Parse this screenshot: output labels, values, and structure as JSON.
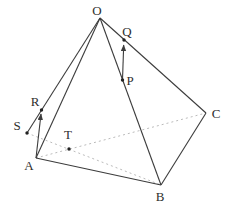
{
  "figure": {
    "width": 230,
    "height": 212,
    "background": "#ffffff",
    "solid_color": "#3c3c3c",
    "dashed_color": "#b3b3b3",
    "dot_color": "#222222",
    "label_color": "#2e2e2e",
    "solid_width": 1.1,
    "dashed_width": 0.9,
    "dash_pattern": "2 3",
    "dot_radius": 1.7,
    "points": {
      "O": {
        "x": 100,
        "y": 18
      },
      "A": {
        "x": 36,
        "y": 158
      },
      "B": {
        "x": 161,
        "y": 185
      },
      "C": {
        "x": 206,
        "y": 113
      },
      "S": {
        "x": 27,
        "y": 133
      },
      "R": {
        "x": 41.5,
        "y": 110
      },
      "T": {
        "x": 69,
        "y": 149
      },
      "P": {
        "x": 122.5,
        "y": 80
      },
      "Q": {
        "x": 124,
        "y": 40
      }
    },
    "labels": [
      {
        "for": "O",
        "text": "O",
        "x": 97,
        "y": 15
      },
      {
        "for": "A",
        "text": "A",
        "x": 29,
        "y": 170
      },
      {
        "for": "B",
        "text": "B",
        "x": 160,
        "y": 201
      },
      {
        "for": "C",
        "text": "C",
        "x": 216,
        "y": 118
      },
      {
        "for": "S",
        "text": "S",
        "x": 17,
        "y": 130
      },
      {
        "for": "R",
        "text": "R",
        "x": 35,
        "y": 106
      },
      {
        "for": "T",
        "text": "T",
        "x": 68,
        "y": 139
      },
      {
        "for": "P",
        "text": "P",
        "x": 130,
        "y": 85
      },
      {
        "for": "Q",
        "text": "Q",
        "x": 127,
        "y": 36
      }
    ],
    "solid_edges": [
      {
        "from": "O",
        "to": "A"
      },
      {
        "from": "O",
        "to": "B"
      },
      {
        "from": "O",
        "to": "C"
      },
      {
        "from": "A",
        "to": "B"
      },
      {
        "from": "B",
        "to": "C"
      },
      {
        "from": "S",
        "to": "O"
      }
    ],
    "dashed_edges": [
      {
        "from": "A",
        "to": "C"
      },
      {
        "from": "S",
        "to": "B"
      }
    ],
    "arrows": [
      {
        "name": "vector-A-to-R",
        "from": "A",
        "x2": 41,
        "y2": 114
      },
      {
        "name": "vector-P-to-Q",
        "from": "P",
        "x2": 123.7,
        "y2": 45
      }
    ],
    "dots": [
      "S",
      "R",
      "T",
      "P",
      "Q"
    ]
  }
}
